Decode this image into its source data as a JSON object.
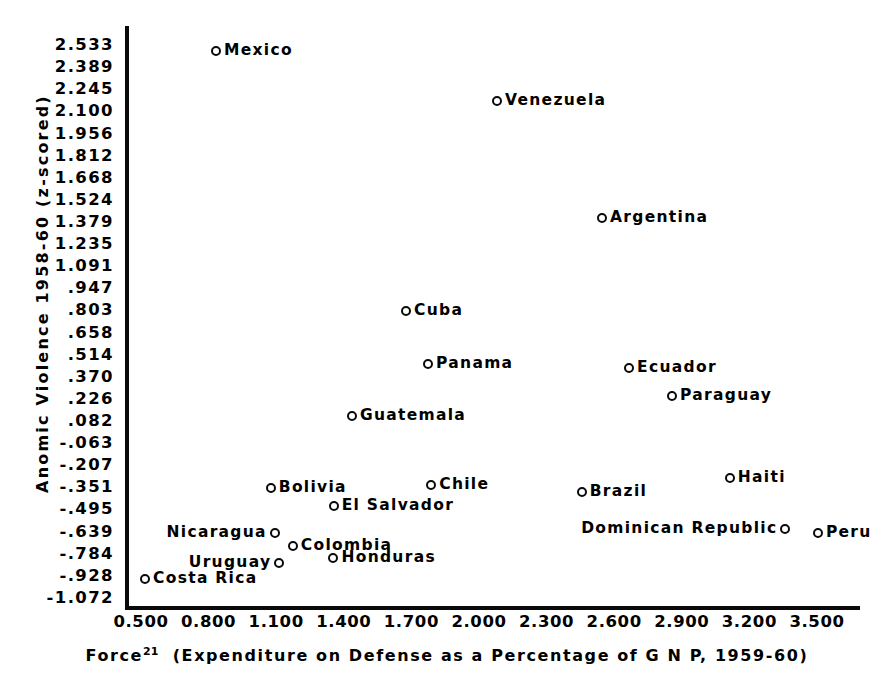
{
  "chart_data": {
    "type": "scatter",
    "title": "",
    "xlabel": "Force21 (Expenditure on Defense as a Percentage of G N P, 1959-60)",
    "ylabel": "Anomic Violence 1958-60 (z-scored)",
    "xlim": [
      0.5,
      3.5
    ],
    "ylim": [
      -1.072,
      2.533
    ],
    "grid": false,
    "legend": "none",
    "xticks": [
      "0.500",
      "0.800",
      "1.100",
      "1.400",
      "1.700",
      "2.000",
      "2.300",
      "2.600",
      "2.900",
      "3.200",
      "3.500"
    ],
    "yticks": [
      "2.533",
      "2.389",
      "2.245",
      "2.100",
      "1.956",
      "1.812",
      "1.668",
      "1.524",
      "1.379",
      "1.235",
      "1.091",
      ".947",
      ".803",
      ".658",
      ".514",
      ".370",
      ".226",
      ".082",
      "-.063",
      "-.207",
      "-.351",
      "-.495",
      "-.639",
      "-.784",
      "-.928",
      "-1.072"
    ],
    "points": [
      {
        "label": "Mexico",
        "x": 0.833,
        "y": 2.497,
        "label_side": "right"
      },
      {
        "label": "Venezuela",
        "x": 2.08,
        "y": 2.166,
        "label_side": "right"
      },
      {
        "label": "Argentina",
        "x": 2.546,
        "y": 1.402,
        "label_side": "right"
      },
      {
        "label": "Cuba",
        "x": 1.676,
        "y": 0.802,
        "label_side": "right"
      },
      {
        "label": "Panama",
        "x": 1.774,
        "y": 0.453,
        "label_side": "right"
      },
      {
        "label": "Ecuador",
        "x": 2.666,
        "y": 0.429,
        "label_side": "right"
      },
      {
        "label": "Paraguay",
        "x": 2.857,
        "y": 0.248,
        "label_side": "right"
      },
      {
        "label": "Guatemala",
        "x": 1.436,
        "y": 0.117,
        "label_side": "right"
      },
      {
        "label": "Haiti",
        "x": 3.113,
        "y": -0.292,
        "label_side": "right"
      },
      {
        "label": "Chile",
        "x": 1.788,
        "y": -0.334,
        "label_side": "right"
      },
      {
        "label": "Bolivia",
        "x": 1.076,
        "y": -0.352,
        "label_side": "right"
      },
      {
        "label": "Brazil",
        "x": 2.456,
        "y": -0.382,
        "label_side": "right"
      },
      {
        "label": "El Salvador",
        "x": 1.355,
        "y": -0.472,
        "label_side": "right"
      },
      {
        "label": "Dominican Republic",
        "x": 3.36,
        "y": -0.622,
        "label_side": "left"
      },
      {
        "label": "Peru",
        "x": 3.504,
        "y": -0.646,
        "label_side": "right"
      },
      {
        "label": "Nicaragua",
        "x": 1.094,
        "y": -0.646,
        "label_side": "left"
      },
      {
        "label": "Colombia",
        "x": 1.174,
        "y": -0.736,
        "label_side": "right"
      },
      {
        "label": "Honduras",
        "x": 1.354,
        "y": -0.808,
        "label_side": "right"
      },
      {
        "label": "Uruguay",
        "x": 1.114,
        "y": -0.844,
        "label_side": "left"
      },
      {
        "label": "Costa Rica",
        "x": 0.518,
        "y": -0.946,
        "label_side": "right"
      }
    ]
  },
  "axes": {
    "x_title_main": "Force",
    "x_title_superscript": "21",
    "x_title_rest": "(Expenditure on Defense as a Percentage of G N P, 1959-60)",
    "y_title": "Anomic Violence 1958-60 (z-scored)"
  },
  "colors": {
    "ink": "#0a0a0a",
    "background": "#ffffff",
    "marker_fill": "#ffffff"
  }
}
